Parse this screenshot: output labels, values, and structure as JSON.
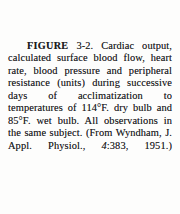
{
  "page": {
    "background_color": "#fdfdfc",
    "text_color": "#1d1d1f",
    "kind": "scanned-book-figure-caption"
  },
  "caption": {
    "figure_label": "FIGURE",
    "figure_number": "3-2.",
    "body_before_volume": "Cardiac output, calculated surface blood flow, heart rate, blood pressure and peripheral resistance (units) during successive days of acclimatization to temperatures of 114°F. dry bulb and 85°F. wet bulb. All observations in the same subject. (From Wyndham, J. Appl. Physiol., ",
    "volume": "4",
    "body_after_volume": ":383, 1951.)",
    "full_text": "FIGURE 3-2. Cardiac output, calculated surface blood flow, heart rate, blood pressure and peripheral resistance (units) during successive days of acclimatization to temperatures of 114°F. dry bulb and 85°F. wet bulb. All observations in the same subject. (From Wyndham, J. Appl. Physiol., 4:383, 1951.)",
    "lines": [
      "FIGURE 3-2. Cardiac output,",
      "calculated surface blood flow,",
      "heart rate, blood pressure and",
      "peripheral resistance (units)",
      "during successive days of ac-",
      "climatization to temperatures of",
      "114°F. dry bulb and 85°F. wet",
      "bulb. All observations in the",
      "same subject. (From Wyndham,",
      "J. Appl. Physiol., 4:383, 1951.)"
    ],
    "citation": {
      "author": "Wyndham",
      "journal": "J. Appl. Physiol.",
      "volume": "4",
      "page": "383",
      "year": "1951"
    },
    "temperatures": {
      "dry_bulb": "114°F.",
      "wet_bulb": "85°F."
    }
  }
}
